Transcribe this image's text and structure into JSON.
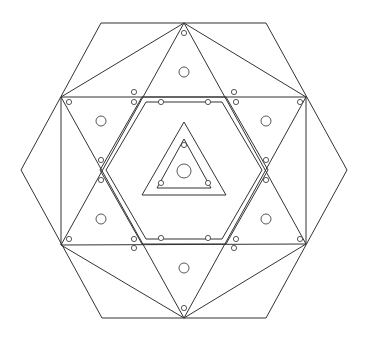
{
  "diagram": {
    "stroke_color": "#333333",
    "background": "#ffffff",
    "outer_hexagon": [
      [
        101,
        23
      ],
      [
        266,
        23
      ],
      [
        347,
        170
      ],
      [
        266,
        318
      ],
      [
        102,
        318
      ],
      [
        21,
        170
      ]
    ],
    "star_vertices": {
      "top": [
        184,
        23
      ],
      "bottom": [
        184,
        318
      ],
      "upper_left": [
        61,
        97
      ],
      "upper_right": [
        306,
        97
      ],
      "lower_left": [
        61,
        245
      ],
      "lower_right": [
        306,
        244
      ]
    },
    "inner_hexagon_outer": [
      [
        142,
        97
      ],
      [
        226,
        97
      ],
      [
        268,
        170
      ],
      [
        226,
        244
      ],
      [
        142,
        244
      ],
      [
        100,
        170
      ]
    ],
    "inner_hexagon_inner": [
      [
        146,
        102
      ],
      [
        222,
        102
      ],
      [
        262,
        170
      ],
      [
        222,
        239
      ],
      [
        146,
        239
      ],
      [
        106,
        170
      ]
    ],
    "center_triangle_outer": [
      [
        184,
        122
      ],
      [
        226,
        195
      ],
      [
        142,
        195
      ]
    ],
    "center_triangle_inner": [
      [
        184,
        139
      ],
      [
        211,
        188
      ],
      [
        157,
        188
      ]
    ],
    "center_hole": {
      "cx": 184,
      "cy": 171,
      "r": 7
    },
    "large_holes": [
      [
        184,
        72
      ],
      [
        101,
        121
      ],
      [
        266,
        121
      ],
      [
        101,
        219
      ],
      [
        266,
        219
      ],
      [
        184,
        268
      ]
    ],
    "small_holes": [
      [
        184,
        33
      ],
      [
        69,
        102
      ],
      [
        134,
        102
      ],
      [
        236,
        102
      ],
      [
        300,
        102
      ],
      [
        161,
        102
      ],
      [
        208,
        102
      ],
      [
        101,
        160
      ],
      [
        101,
        180
      ],
      [
        266,
        160
      ],
      [
        266,
        180
      ],
      [
        69,
        239
      ],
      [
        134,
        239
      ],
      [
        236,
        239
      ],
      [
        300,
        239
      ],
      [
        161,
        238
      ],
      [
        208,
        238
      ],
      [
        184,
        308
      ],
      [
        184,
        145
      ],
      [
        161,
        183
      ],
      [
        208,
        183
      ],
      [
        134,
        92
      ],
      [
        234,
        92
      ],
      [
        134,
        248
      ],
      [
        234,
        248
      ]
    ]
  }
}
